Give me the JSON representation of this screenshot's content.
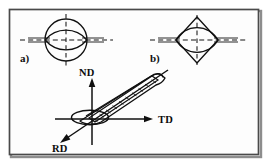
{
  "figure": {
    "background_color": "#ffffff",
    "ink_color": "#101010",
    "frame": {
      "border_color": "#4a4a4a",
      "shadow_color": "#8d8d8d",
      "fill_color": "#fdfdfd"
    },
    "panels": [
      {
        "id": "panel-a",
        "label": "a)",
        "shape": "circle-with-inscribed-lens",
        "description": "Circle cross-section with inscribed lens (two opposed arcs), vertical and horizontal dashed symmetry axes and horizontal double guide lines",
        "outline_color": "#101010",
        "dash_color": "#151515"
      },
      {
        "id": "panel-b",
        "label": "b)",
        "shape": "diamond-with-inscribed-lens",
        "description": "Rhombus cross-section with inscribed lens (two opposed arcs), vertical and horizontal dashed symmetry axes and horizontal double guide lines",
        "outline_color": "#101010",
        "dash_color": "#151515"
      }
    ],
    "axes_diagram": {
      "id": "panel-3d",
      "description": "Elongated grain drawn as an inclined cylinder with internal hatching, with three labelled material direction axes",
      "axes": [
        {
          "name": "ND",
          "label": "ND",
          "direction": "up",
          "arrow": true
        },
        {
          "name": "TD",
          "label": "TD",
          "direction": "right",
          "arrow": true
        },
        {
          "name": "RD",
          "label": "RD",
          "direction": "down-left",
          "arrow": true
        }
      ],
      "grain": {
        "form": "inclined-elongated-cylinder",
        "end_cap": "ellipse",
        "hatching": true,
        "hatch_count": 9
      }
    }
  }
}
